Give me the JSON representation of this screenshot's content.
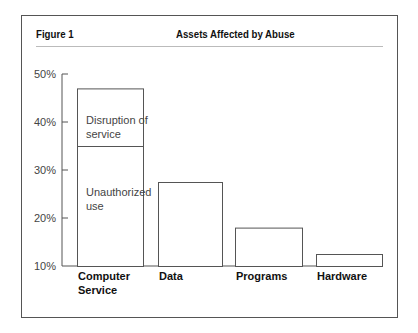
{
  "figure": {
    "label": "Figure 1",
    "title": "Assets Affected by Abuse"
  },
  "chart_data": {
    "type": "bar",
    "stacked": true,
    "title": "Assets Affected by Abuse",
    "xlabel": "",
    "ylabel": "",
    "ylim": [
      10,
      50
    ],
    "yticks": [
      10,
      20,
      30,
      40,
      50
    ],
    "ytick_labels": [
      "10%",
      "20%",
      "30%",
      "40%",
      "50%"
    ],
    "grid": false,
    "categories": [
      "Computer Service",
      "Data",
      "Programs",
      "Hardware"
    ],
    "category_label_lines": [
      [
        "Computer",
        "Service"
      ],
      [
        "Data"
      ],
      [
        "Programs"
      ],
      [
        "Hardware"
      ]
    ],
    "totals": [
      47,
      27.5,
      18,
      12.5
    ],
    "series": [
      {
        "name": "Unauthorized use",
        "label_lines": [
          "Unauthorized",
          "use"
        ],
        "values": [
          35,
          27.5,
          18,
          12.5
        ]
      },
      {
        "name": "Disruption of service",
        "label_lines": [
          "Disruption of",
          "service"
        ],
        "values": [
          12,
          0,
          0,
          0
        ]
      }
    ]
  }
}
